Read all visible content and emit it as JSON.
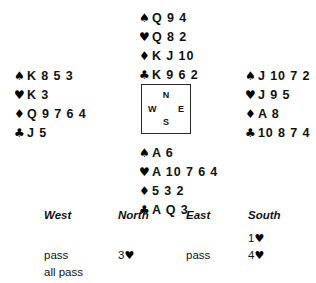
{
  "diagram": {
    "type": "bridge-deal",
    "suit_symbols": {
      "spade": "♠",
      "heart": "♥",
      "diamond": "♦",
      "club": "♣"
    },
    "compass": {
      "north": "N",
      "south": "S",
      "east": "E",
      "west": "W"
    },
    "hands": {
      "north": {
        "label": "North",
        "spades": "Q 9 4",
        "hearts": "Q 8 2",
        "diamonds": "K J 10",
        "clubs": "K 9 6 2"
      },
      "west": {
        "label": "West",
        "spades": "K 8 5 3",
        "hearts": "K 3",
        "diamonds": "Q 9 7 6 4",
        "clubs": "J 5"
      },
      "east": {
        "label": "East",
        "spades": "J 10 7 2",
        "hearts": "J 9 5",
        "diamonds": "A 8",
        "clubs": "10 8 7 4"
      },
      "south": {
        "label": "South",
        "spades": "A 6",
        "hearts": "A 10 7 6 4",
        "diamonds": "5 3 2",
        "clubs": "A Q 3"
      }
    }
  },
  "auction": {
    "headers": {
      "west": "West",
      "north": "North",
      "east": "East",
      "south": "South"
    },
    "rows": [
      {
        "west": "",
        "north": "",
        "east": "",
        "south_level": "1",
        "south_suit": "♥"
      },
      {
        "west": "pass",
        "north_level": "3",
        "north_suit": "♥",
        "east": "pass",
        "south_level": "4",
        "south_suit": "♥"
      },
      {
        "west": "all pass",
        "north": "",
        "east": "",
        "south": ""
      }
    ]
  }
}
